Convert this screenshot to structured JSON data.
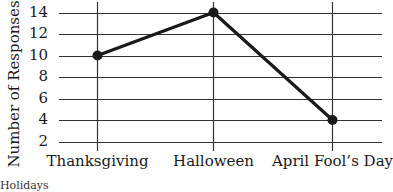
{
  "chart_data": {
    "type": "line",
    "title": "",
    "xlabel": "",
    "ylabel": "Number of Responses",
    "categories": [
      "Thanksgiving",
      "Halloween",
      "April Fool’s Day"
    ],
    "series": [
      {
        "name": "Responses",
        "values": [
          10,
          14,
          4
        ],
        "color": "#1a1a1a"
      }
    ],
    "yticks": [
      2,
      4,
      6,
      8,
      10,
      12,
      14
    ],
    "ylim": [
      2,
      14
    ],
    "grid": {
      "horizontal": true,
      "vertical": true
    },
    "legend": null
  },
  "labels": {
    "ylabel": "Number of Responses",
    "yticks": [
      "2",
      "4",
      "6",
      "8",
      "10",
      "12",
      "14"
    ],
    "xticks": [
      "Thanksgiving",
      "Halloween",
      "April Fool’s Day"
    ],
    "footer": "Holidays"
  },
  "colors": {
    "line": "#1a1a1a",
    "grid": "#333333",
    "background": "#ffffff"
  }
}
